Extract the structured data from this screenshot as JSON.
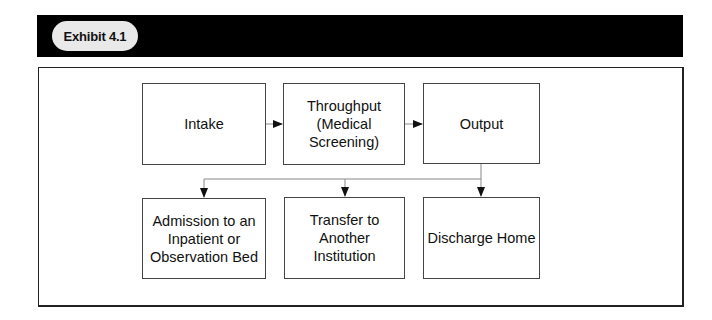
{
  "exhibit": {
    "label": "Exhibit 4.1"
  },
  "diagram": {
    "nodes": {
      "intake": "Intake",
      "throughput": "Throughput\n(Medical\nScreening)",
      "output": "Output",
      "admission": "Admission to an\nInpatient or\nObservation Bed",
      "transfer": "Transfer to\nAnother\nInstitution",
      "discharge": "Discharge Home"
    },
    "edges": [
      {
        "from": "Intake",
        "to": "Throughput (Medical Screening)"
      },
      {
        "from": "Throughput (Medical Screening)",
        "to": "Output"
      },
      {
        "from": "Output",
        "to": "Admission to an Inpatient or Observation Bed"
      },
      {
        "from": "Output",
        "to": "Transfer to Another Institution"
      },
      {
        "from": "Output",
        "to": "Discharge Home"
      }
    ],
    "colors": {
      "header_bar": "#000000",
      "pill": "#e9e9e9",
      "box_border": "#444444",
      "connector": "#888888",
      "arrowhead": "#111111"
    }
  }
}
